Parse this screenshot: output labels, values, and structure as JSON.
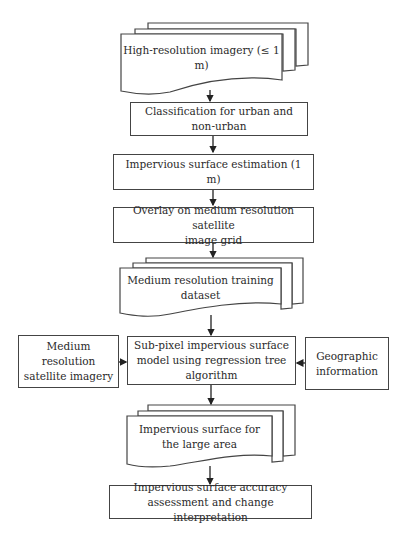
{
  "diagram": {
    "type": "flowchart",
    "nodes": {
      "high_res_imagery": "High-resolution imagery (≤ 1 m)",
      "classification_line1": "Classification for urban and",
      "classification_line2": "non-urban",
      "impervious_estimation": "Impervious surface estimation (1 m)",
      "overlay_line1": "Overlay on medium resolution satellite",
      "overlay_line2": "image grid",
      "training_dataset": "Medium resolution training dataset",
      "medium_res_imagery_line1": "Medium resolution",
      "medium_res_imagery_line2": "satellite imagery",
      "subpixel_model_line1": "Sub-pixel impervious surface",
      "subpixel_model_line2": "model using regression tree",
      "subpixel_model_line3": "algorithm",
      "geographic_info_line1": "Geographic",
      "geographic_info_line2": "information",
      "large_area_line1": "Impervious surface for",
      "large_area_line2": "the large area",
      "accuracy_line1": "Impervious surface accuracy",
      "accuracy_line2": "assessment and change interpretation"
    },
    "edges": [
      [
        "high_res_imagery",
        "classification"
      ],
      [
        "classification",
        "impervious_estimation"
      ],
      [
        "impervious_estimation",
        "overlay"
      ],
      [
        "overlay",
        "training_dataset"
      ],
      [
        "training_dataset",
        "subpixel_model"
      ],
      [
        "medium_res_imagery",
        "subpixel_model"
      ],
      [
        "geographic_info",
        "subpixel_model"
      ],
      [
        "subpixel_model",
        "large_area"
      ],
      [
        "large_area",
        "accuracy"
      ]
    ],
    "colors": {
      "stroke": "#444444",
      "text": "#2a2a2a",
      "background": "#ffffff"
    }
  }
}
